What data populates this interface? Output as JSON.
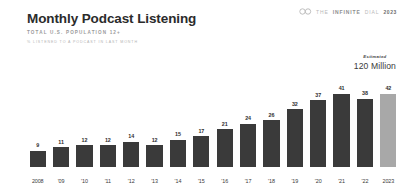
{
  "header": {
    "title": "Monthly Podcast Listening",
    "subtitle_population": "TOTAL U.S. POPULATION 12+",
    "subtitle_metric": "% LISTENED TO A PODCAST IN LAST MONTH"
  },
  "brand": {
    "mark_icon": "infinity-icon",
    "the": "THE",
    "infinite": "INFINITE",
    "dial": "DIAL",
    "year": "2023"
  },
  "callout": {
    "label": "Estimated",
    "value": "120 Million"
  },
  "colors": {
    "bar_default": "#3a3a3a",
    "bar_highlight": "#a8a8a8",
    "background": "#ffffff",
    "title": "#2b2b2b",
    "subtitle": "#9a9a9a"
  },
  "chart_data": {
    "type": "bar",
    "title": "Monthly Podcast Listening",
    "subtitle": "TOTAL U.S. POPULATION 12+",
    "xlabel": "",
    "ylabel": "% LISTENED TO A PODCAST IN LAST MONTH",
    "ylim": [
      0,
      45
    ],
    "grid": false,
    "legend": false,
    "categories": [
      "2008",
      "'09",
      "'10",
      "'11",
      "'12",
      "'13",
      "'14",
      "'15",
      "'16",
      "'17",
      "'18",
      "'19",
      "'20",
      "'21",
      "'22",
      "2023"
    ],
    "values": [
      9,
      11,
      12,
      12,
      14,
      12,
      15,
      17,
      21,
      24,
      26,
      32,
      37,
      41,
      38,
      42
    ],
    "highlight_index": 15,
    "annotations": [
      {
        "text": "Estimated 120 Million",
        "target_category": "2023"
      }
    ]
  }
}
